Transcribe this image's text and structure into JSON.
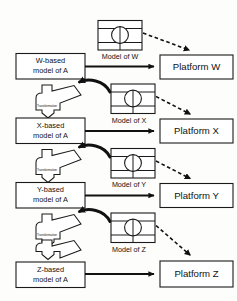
{
  "diagram": {
    "colors": {
      "stroke": "#1a1a1a",
      "fill": "#ffffff",
      "background": "#fdfdfb",
      "arrow": "#111111"
    },
    "rows": [
      {
        "key": "w",
        "source_box_line1": "W-based",
        "source_box_line2": "model of A",
        "model_caption": "Model of W",
        "platform_label": "Platform W",
        "transform_label": "Transformation"
      },
      {
        "key": "x",
        "source_box_line1": "X-based",
        "source_box_line2": "model of A",
        "model_caption": "Model of X",
        "platform_label": "Platform X",
        "transform_label": "Transformation"
      },
      {
        "key": "y",
        "source_box_line1": "Y-based",
        "source_box_line2": "model of A",
        "model_caption": "Model of Y",
        "platform_label": "Platform Y",
        "transform_label": "Transformation"
      },
      {
        "key": "z",
        "source_box_line1": "Z-based",
        "source_box_line2": "model of A",
        "model_caption": "Model of Z",
        "platform_label": "Platform Z",
        "transform_label": "Transformation"
      }
    ],
    "icons": {
      "model_icon": "model-diagram-icon",
      "transform_icon": "transformation-block-arrow-icon",
      "mapping_icon": "curved-mapping-arrow-icon",
      "deploy_icon": "dashed-deployment-arrow-icon",
      "realize_icon": "solid-realization-arrow-icon"
    }
  }
}
